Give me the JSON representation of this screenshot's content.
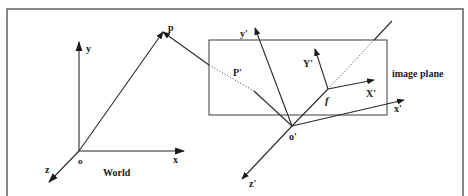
{
  "figure": {
    "type": "camera-projection-diagram",
    "world": {
      "label": "World",
      "origin_label": "o",
      "axes": {
        "x": "x",
        "y": "y",
        "z": "z"
      }
    },
    "point": {
      "label": "p"
    },
    "projected_point": {
      "label": "P'"
    },
    "camera": {
      "origin_label": "o'",
      "axes": {
        "x": "x'",
        "y": "y'",
        "z": "z'"
      },
      "focal_label": "f"
    },
    "image_plane": {
      "label": "image plane",
      "axes": {
        "x": "X'",
        "y": "Y'"
      }
    }
  },
  "geometry": {
    "frame": {
      "x1": 7,
      "y1": 9,
      "x2": 463,
      "y2": 200
    },
    "world_origin": [
      79,
      151
    ],
    "world_y_tip": [
      79,
      42
    ],
    "world_x_tip": [
      184,
      151
    ],
    "world_z_tip": [
      49,
      182
    ],
    "p": [
      163,
      32
    ],
    "plane_rect": [
      209,
      40,
      387,
      115
    ],
    "cam_origin": [
      292,
      126
    ],
    "cam_y_tip": [
      255,
      28
    ],
    "cam_x_tip": [
      404,
      100
    ],
    "cam_z_tip": [
      242,
      179
    ],
    "f": [
      328,
      89
    ],
    "img_Y_tip": [
      315,
      49
    ],
    "img_X_tip": [
      374,
      80
    ],
    "optical_far": [
      392,
      21
    ],
    "p_plane_entry": [
      209,
      65
    ],
    "P_prime": [
      254,
      91
    ]
  }
}
